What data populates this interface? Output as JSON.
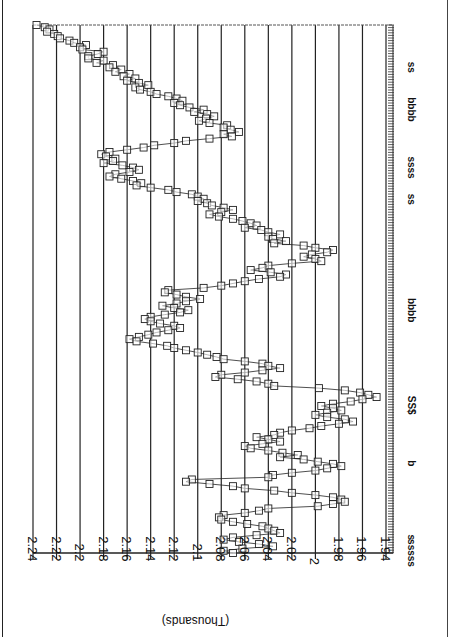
{
  "chart_data": {
    "type": "line",
    "orientation": "rotated 180 degrees (value axis horizontal at bottom, time axis vertical on right)",
    "title": "",
    "ylabel": "(Thousands)",
    "xlabel": "",
    "ylim": [
      1.94,
      2.24
    ],
    "y_ticks": [
      "2.24",
      "2.22",
      "2.2",
      "2.18",
      "2.16",
      "2.14",
      "2.12",
      "2.1",
      "2.08",
      "2.06",
      "2.04",
      "2.02",
      "2",
      "1.98",
      "1.96",
      "1.94"
    ],
    "x_tick_labels_garbled": [
      {
        "label": "ss",
        "pos": 0.08
      },
      {
        "label": "bbbb",
        "pos": 0.16
      },
      {
        "label": "ssss",
        "pos": 0.27
      },
      {
        "label": "ss",
        "pos": 0.33
      },
      {
        "label": "bbbb",
        "pos": 0.54
      },
      {
        "label": "SS$",
        "pos": 0.72
      },
      {
        "label": "b",
        "pos": 0.83
      },
      {
        "label": "s",
        "pos": 0.97
      },
      {
        "label": "sssss",
        "pos": 1.0
      }
    ],
    "grid": true,
    "marker": "open-square",
    "legend": null,
    "series": [
      {
        "name": "series-1",
        "points_note": "index 0 = top of image (latest/first plotted), values in thousands",
        "values": [
          2.237,
          2.23,
          2.226,
          2.228,
          2.222,
          2.219,
          2.217,
          2.209,
          2.205,
          2.195,
          2.2,
          2.198,
          2.18,
          2.185,
          2.193,
          2.193,
          2.18,
          2.186,
          2.172,
          2.175,
          2.165,
          2.17,
          2.158,
          2.163,
          2.153,
          2.16,
          2.15,
          2.142,
          2.153,
          2.149,
          2.14,
          2.135,
          2.125,
          2.118,
          2.113,
          2.12,
          2.115,
          2.107,
          2.095,
          2.103,
          2.092,
          2.086,
          2.093,
          2.099,
          2.09,
          2.075,
          2.078,
          2.072,
          2.065,
          2.078,
          2.071,
          2.09,
          2.11,
          2.12,
          2.137,
          2.146,
          2.16,
          2.175,
          2.182,
          2.178,
          2.17,
          2.172,
          2.18,
          2.164,
          2.155,
          2.15,
          2.158,
          2.17,
          2.175,
          2.165,
          2.155,
          2.148,
          2.152,
          2.14,
          2.125,
          2.118,
          2.105,
          2.1,
          2.095,
          2.1,
          2.092,
          2.088,
          2.078,
          2.07,
          2.08,
          2.09,
          2.082,
          2.07,
          2.062,
          2.055,
          2.05,
          2.06,
          2.046,
          2.04,
          2.03,
          2.04,
          2.036,
          2.025,
          2.035,
          2.01,
          2.0,
          1.985,
          1.99,
          2.003,
          2.01,
          2.0,
          1.995,
          2.02,
          2.04,
          2.045,
          2.055,
          2.038,
          2.025,
          2.03,
          2.048,
          2.06,
          2.07,
          2.08,
          2.095,
          2.125,
          2.128,
          2.118,
          2.11,
          2.098,
          2.11,
          2.118,
          2.13,
          2.12,
          2.108,
          2.115,
          2.128,
          2.14,
          2.145,
          2.14,
          2.132,
          2.12,
          2.115,
          2.125,
          2.135,
          2.142,
          2.15,
          2.158,
          2.152,
          2.138,
          2.126,
          2.12,
          2.11,
          2.1,
          2.092,
          2.084,
          2.078,
          2.06,
          2.045,
          2.04,
          2.03,
          2.045,
          2.06,
          2.08,
          2.085,
          2.066,
          2.05,
          2.04,
          2.035,
          1.997,
          1.975,
          1.962,
          1.955,
          1.948,
          1.96,
          1.97,
          1.985,
          1.995,
          1.985,
          1.978,
          1.99,
          2.0,
          1.99,
          1.975,
          1.968,
          1.98,
          1.995,
          2.005,
          2.02,
          2.03,
          2.035,
          2.05,
          2.04,
          2.03,
          2.045,
          2.06,
          2.055,
          2.04,
          2.028,
          2.015,
          2.03,
          2.01,
          1.998,
          1.985,
          1.978,
          1.99,
          2.0,
          2.02,
          2.036,
          2.04,
          2.105,
          2.11,
          2.09,
          2.07,
          2.06,
          2.035,
          2.02,
          2.0,
          1.985,
          1.978,
          1.975,
          1.985,
          1.998,
          2.04,
          2.048,
          2.06,
          2.078,
          2.082,
          2.08,
          2.07,
          2.058,
          2.045,
          2.04,
          2.035,
          2.03,
          2.05,
          2.07,
          2.078,
          2.065,
          2.048,
          2.036,
          2.062,
          2.078,
          2.07
        ]
      }
    ]
  }
}
